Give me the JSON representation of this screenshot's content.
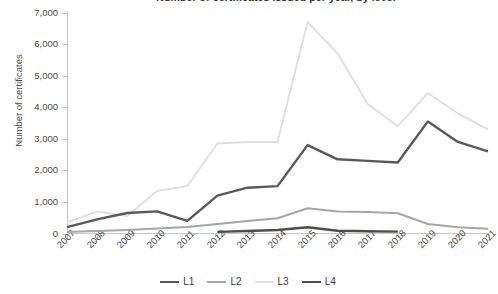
{
  "chart_data": {
    "type": "line",
    "title": "Number of certificates issued per year, by level",
    "xlabel": "",
    "ylabel": "Number of certificates",
    "x": [
      2007,
      2008,
      2009,
      2010,
      2011,
      2012,
      2013,
      2014,
      2015,
      2016,
      2017,
      2018,
      2019,
      2020,
      2021
    ],
    "categories": [
      "2007",
      "2008",
      "2009",
      "2010",
      "2011",
      "2012",
      "2013",
      "2014",
      "2015",
      "2016",
      "2017",
      "2018",
      "2019",
      "2020",
      "2021"
    ],
    "ylim": [
      0,
      7000
    ],
    "yticks": [
      0,
      1000,
      2000,
      3000,
      4000,
      5000,
      6000,
      7000
    ],
    "ytick_labels": [
      "0",
      "1,000",
      "2,000",
      "3,000",
      "4,000",
      "5,000",
      "6,000",
      "7,000"
    ],
    "grid": false,
    "legend_position": "bottom",
    "series": [
      {
        "name": "L1",
        "color": "#595959",
        "values": [
          200,
          450,
          650,
          700,
          400,
          1200,
          1450,
          1500,
          2800,
          2350,
          2300,
          2250,
          3550,
          2900,
          2600
        ]
      },
      {
        "name": "L2",
        "color": "#a6a6a6",
        "values": [
          50,
          80,
          110,
          160,
          210,
          300,
          400,
          480,
          800,
          700,
          680,
          640,
          300,
          200,
          150
        ]
      },
      {
        "name": "L3",
        "color": "#e0e0e0",
        "values": [
          350,
          700,
          550,
          1350,
          1500,
          2850,
          2900,
          2900,
          6700,
          5700,
          4100,
          3400,
          4450,
          3800,
          3300
        ]
      },
      {
        "name": "L4",
        "color": "#4d4d4d",
        "values": [
          null,
          null,
          null,
          null,
          null,
          50,
          80,
          110,
          200,
          90,
          70,
          60,
          null,
          null,
          null
        ]
      }
    ]
  },
  "legend": {
    "items": [
      {
        "label": "L1",
        "color": "#595959"
      },
      {
        "label": "L2",
        "color": "#a6a6a6"
      },
      {
        "label": "L3",
        "color": "#e0e0e0"
      },
      {
        "label": "L4",
        "color": "#4d4d4d"
      }
    ]
  },
  "axes": {
    "y_axis_title": "Number of certificates"
  }
}
